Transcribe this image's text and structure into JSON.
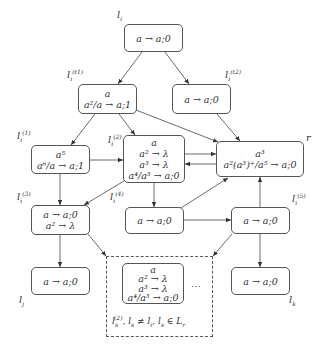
{
  "diagram": {
    "nodes": [
      {
        "id": "li",
        "label": "l_i",
        "lines": [
          "a → a;0"
        ]
      },
      {
        "id": "t1",
        "label": "l_i^(t1)",
        "lines": [
          "a",
          "a²/a → a;1"
        ]
      },
      {
        "id": "t2",
        "label": "l_i^(t2)",
        "lines": [
          "a → a;0"
        ]
      },
      {
        "id": "l1",
        "label": "l_i^(1)",
        "lines": [
          "a⁵",
          "a⁶/a → a;1"
        ]
      },
      {
        "id": "l2",
        "label": "l_i^(2)",
        "lines": [
          "a",
          "a² → λ",
          "a³ → λ",
          "a⁴/a³ → a;0"
        ]
      },
      {
        "id": "r",
        "label": "r",
        "lines": [
          "a³",
          "a²(a³)⁺/a⁵ → a;0"
        ]
      },
      {
        "id": "l3",
        "label": "l_i^(3)",
        "lines": [
          "a → a;0",
          "a² → λ"
        ]
      },
      {
        "id": "l4",
        "label": "l_i^(4)",
        "lines": [
          "a → a;0"
        ]
      },
      {
        "id": "l5",
        "label": "l_i^(5)",
        "lines": [
          "a → a;0"
        ]
      },
      {
        "id": "lj",
        "label": "l_j",
        "lines": [
          "a → a;0"
        ]
      },
      {
        "id": "lk",
        "label": "l_k",
        "lines": [
          "a → a;0"
        ]
      },
      {
        "id": "ls",
        "label": "",
        "lines": [
          "a",
          "a² → λ",
          "a³ → λ",
          "a⁴/a³ → a;0"
        ]
      }
    ],
    "group": {
      "caption": "l_s^(2), l_s ≠ l_i, l_s ∈ L_r",
      "ellipsis": "…"
    },
    "edges": [
      [
        "li",
        "t1"
      ],
      [
        "li",
        "t2"
      ],
      [
        "t1",
        "l1"
      ],
      [
        "t1",
        "l2"
      ],
      [
        "t1",
        "r"
      ],
      [
        "t2",
        "r"
      ],
      [
        "l1",
        "l2"
      ],
      [
        "l1",
        "l3"
      ],
      [
        "l2",
        "l3"
      ],
      [
        "l2",
        "l4"
      ],
      [
        "l2",
        "r"
      ],
      [
        "r",
        "l2"
      ],
      [
        "l4",
        "r"
      ],
      [
        "l4",
        "l5"
      ],
      [
        "l5",
        "r"
      ],
      [
        "l3",
        "lj"
      ],
      [
        "l5",
        "lk"
      ],
      [
        "l3",
        "group"
      ],
      [
        "l5",
        "group"
      ]
    ],
    "labels": {
      "li": "l",
      "li_sub": "i",
      "t1": "l",
      "t1_sub": "i",
      "t1_sup": "(t1)",
      "t2": "l",
      "t2_sub": "i",
      "t2_sup": "(t2)",
      "l1": "l",
      "l1_sub": "i",
      "l1_sup": "(1)",
      "l2": "l",
      "l2_sub": "i",
      "l2_sup": "(2)",
      "l3": "l",
      "l3_sub": "i",
      "l3_sup": "(3)",
      "l4": "l",
      "l4_sub": "i",
      "l4_sup": "(4)",
      "l5": "l",
      "l5_sub": "i",
      "l5_sup": "(5)",
      "r": "r",
      "lj": "l",
      "lj_sub": "j",
      "lk": "l",
      "lk_sub": "k"
    },
    "text": {
      "li_1": "a → a;0",
      "t1_1": "a",
      "t1_2": "a²/a → a;1",
      "t2_1": "a → a;0",
      "l1_1": "a⁵",
      "l1_2": "a⁶/a → a;1",
      "l2_1": "a",
      "l2_2": "a² → λ",
      "l2_3": "a³ → λ",
      "l2_4": "a⁴/a³ → a;0",
      "r_1": "a³",
      "r_2": "a²(a³)⁺/a⁵ → a;0",
      "l3_1": "a → a;0",
      "l3_2": "a² → λ",
      "l4_1": "a → a;0",
      "l5_1": "a → a;0",
      "lj_1": "a → a;0",
      "lk_1": "a → a;0",
      "ls_1": "a",
      "ls_2": "a² → λ",
      "ls_3": "a³ → λ",
      "ls_4": "a⁴/a³ → a;0",
      "caption_l": "l",
      "caption_sub": "s",
      "caption_sup": "(2)",
      "caption_rest": ", l",
      "caption_sub2": "s",
      "caption_ne": " ≠ l",
      "caption_sub3": "i",
      "caption_in": ", l",
      "caption_sub4": "s",
      "caption_elem": " ∈ L",
      "caption_sub5": "r",
      "ellipsis": "…"
    },
    "colors": {
      "stroke": "#444444",
      "text": "#333333",
      "background": "#ffffff"
    }
  }
}
